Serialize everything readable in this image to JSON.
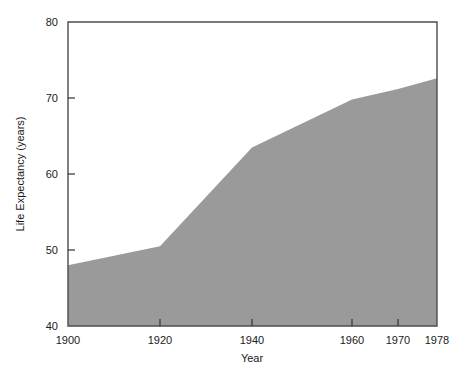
{
  "chart_data": {
    "type": "area",
    "title": "",
    "xlabel": "Year",
    "ylabel": "Life Expectancy (years)",
    "xlim": [
      1898,
      1978
    ],
    "ylim": [
      40,
      80
    ],
    "grid": false,
    "legend": "none",
    "fill_color": "#9a9a9a",
    "x": [
      1900,
      1920,
      1940,
      1960,
      1970,
      1978
    ],
    "values": [
      48.0,
      50.5,
      63.5,
      69.8,
      71.2,
      72.6
    ],
    "series": [
      {
        "name": "Life Expectancy",
        "values": [
          48.0,
          50.5,
          63.5,
          69.8,
          71.2,
          72.6
        ]
      }
    ],
    "x_tick_labels": [
      "1900",
      "1920",
      "1940",
      "1960",
      "1970",
      "1978"
    ],
    "x_tick_values": [
      1900,
      1920,
      1940,
      1960,
      1970,
      1978
    ],
    "y_tick_labels": [
      "40",
      "50",
      "60",
      "70",
      "80"
    ],
    "y_tick_values": [
      40,
      50,
      60,
      70,
      80
    ],
    "annotations": []
  },
  "axes": {
    "x_title": "Year",
    "y_title": "Life Expectancy (years)"
  },
  "x_ticks": [
    {
      "label": "1900",
      "px": 68
    },
    {
      "label": "1920",
      "px": 160
    },
    {
      "label": "1940",
      "px": 252
    },
    {
      "label": "1960",
      "px": 352
    },
    {
      "label": "1970",
      "px": 398
    },
    {
      "label": "1978",
      "px": 437
    }
  ],
  "y_ticks": [
    {
      "label": "80",
      "px": 22
    },
    {
      "label": "70",
      "px": 98
    },
    {
      "label": "60",
      "px": 174
    },
    {
      "label": "50",
      "px": 250
    },
    {
      "label": "40",
      "px": 326
    }
  ]
}
